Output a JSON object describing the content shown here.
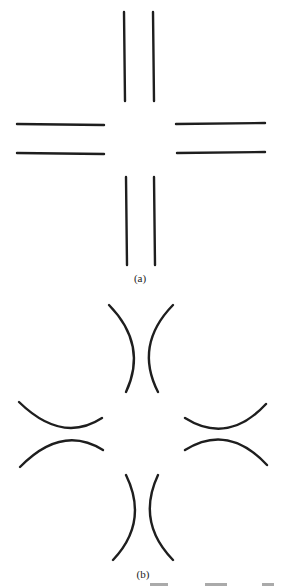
{
  "figure": {
    "panels": [
      {
        "id": "a",
        "caption": "(a)",
        "description": "Four pairs of parallel straight line segments arranged in a cross pattern",
        "segments": [
          {
            "name": "top-left-vertical",
            "x1": 124,
            "y1": 12,
            "x2": 125,
            "y2": 101
          },
          {
            "name": "top-right-vertical",
            "x1": 153,
            "y1": 12,
            "x2": 154,
            "y2": 101
          },
          {
            "name": "left-upper-horizontal",
            "x1": 17,
            "y1": 124,
            "x2": 104,
            "y2": 125
          },
          {
            "name": "left-lower-horizontal",
            "x1": 17,
            "y1": 153,
            "x2": 104,
            "y2": 154
          },
          {
            "name": "right-upper-horizontal",
            "x1": 176,
            "y1": 124,
            "x2": 265,
            "y2": 123
          },
          {
            "name": "right-lower-horizontal",
            "x1": 177,
            "y1": 153,
            "x2": 265,
            "y2": 152
          },
          {
            "name": "bottom-left-vertical",
            "x1": 126,
            "y1": 177,
            "x2": 127,
            "y2": 265
          },
          {
            "name": "bottom-right-vertical",
            "x1": 154,
            "y1": 177,
            "x2": 155,
            "y2": 265
          }
        ]
      },
      {
        "id": "b",
        "caption": "(b)",
        "description": "Four pairs of curved arcs, concave away from each other, arranged in a cross pattern",
        "arcs": [
          {
            "name": "top-left-arc",
            "d": "M109 305 Q 148 345 126 392"
          },
          {
            "name": "top-right-arc",
            "d": "M173 305 Q 134 345 158 392"
          },
          {
            "name": "left-upper-arc",
            "d": "M19 402 Q 62 444 102 418"
          },
          {
            "name": "left-lower-arc",
            "d": "M20 467 Q 62 424 103 450"
          },
          {
            "name": "right-upper-arc",
            "d": "M185 418 Q 228 445 266 404"
          },
          {
            "name": "right-lower-arc",
            "d": "M185 450 Q 228 423 267 465"
          },
          {
            "name": "bottom-left-arc",
            "d": "M126 475 Q 149 522 113 560"
          },
          {
            "name": "bottom-right-arc",
            "d": "M158 475 Q 136 522 173 560"
          }
        ]
      }
    ],
    "stroke_color": "#1e1e1e",
    "background_color": "#ffffff"
  }
}
